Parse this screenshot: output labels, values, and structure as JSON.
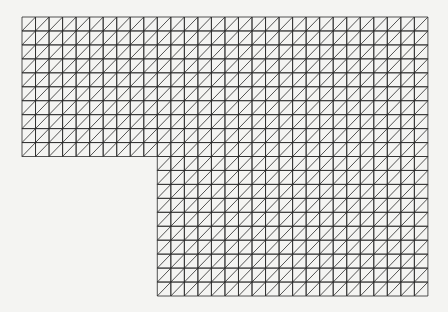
{
  "diagram": {
    "type": "triangulated-mesh",
    "shape": "L-shaped domain",
    "background": "#f4f4f2",
    "line_color": "#2a2a2a",
    "origin_px": [
      22,
      17
    ],
    "cell_px": [
      13.53,
      13.95
    ],
    "columns": 30,
    "rows": 20,
    "removed_block": {
      "col_start": 0,
      "col_end": 10,
      "row_start": 10,
      "row_end": 20
    },
    "diagonal": "bottom-left-to-top-right"
  }
}
